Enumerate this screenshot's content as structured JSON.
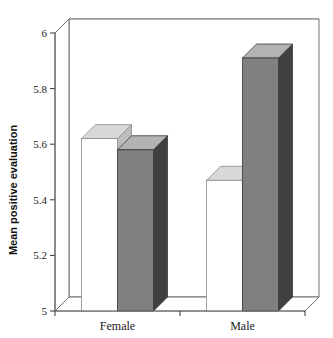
{
  "chart_data": {
    "type": "bar",
    "title": "",
    "subtitle": "",
    "xlabel": "",
    "ylabel": "Mean positive evaluation",
    "categories": [
      "Female",
      "Male"
    ],
    "series": [
      {
        "name": "series-1",
        "color": "#ffffff",
        "values": [
          5.62,
          5.47
        ]
      },
      {
        "name": "series-2",
        "color": "#808080",
        "values": [
          5.58,
          5.91
        ]
      }
    ],
    "ylim": [
      5,
      6
    ],
    "yticks": [
      5,
      5.2,
      5.4,
      5.6,
      5.8,
      6
    ],
    "ytick_labels": [
      "5",
      "5.2",
      "5.4",
      "5.6",
      "5.8",
      "6"
    ],
    "grid": true,
    "grid_axis": "y",
    "legend": false,
    "legend_position": "none",
    "three_d": true,
    "annotations": []
  },
  "axes": {
    "y_title": "Mean positive evaluation",
    "y_labels": [
      "6",
      "5.8",
      "5.6",
      "5.4",
      "5.2",
      "5"
    ],
    "x_labels": [
      "Female",
      "Male"
    ]
  },
  "style": {
    "background": "#ffffff",
    "frame_color": "#6e6e6e",
    "grid_color": "#8a8a8a",
    "bar_white_front": "#ffffff",
    "bar_white_top": "#d8d8d8",
    "bar_white_side": "#bdbdbd",
    "bar_gray_front": "#808080",
    "bar_gray_top": "#b3b3b3",
    "bar_gray_side": "#404040",
    "floor_color": "#ffffff",
    "text_color": "#1a1a1a"
  }
}
